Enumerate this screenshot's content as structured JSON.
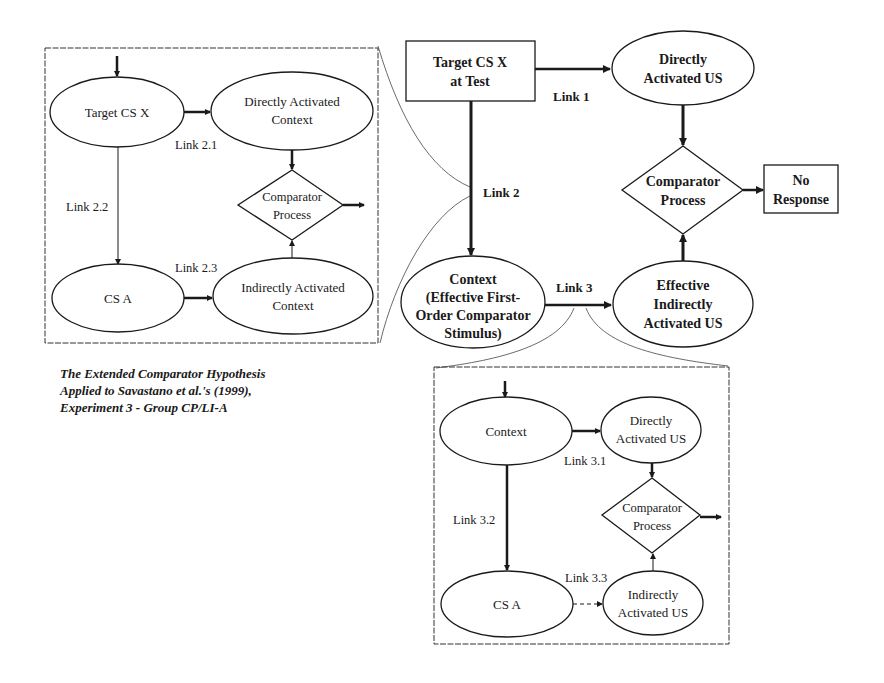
{
  "main_diagram": {
    "nodes": {
      "target": {
        "line1": "Target CS X",
        "line2": "at Test"
      },
      "direct_us": {
        "line1": "Directly",
        "line2": "Activated US"
      },
      "comparator": {
        "line1": "Comparator",
        "line2": "Process"
      },
      "no_response": {
        "line1": "No",
        "line2": "Response"
      },
      "context": {
        "line1": "Context",
        "line2": "(Effective First-",
        "line3": "Order Comparator",
        "line4": "Stimulus)"
      },
      "effective_indirect_us": {
        "line1": "Effective",
        "line2": "Indirectly",
        "line3": "Activated US"
      }
    },
    "links": {
      "link1": "Link 1",
      "link2": "Link 2",
      "link3": "Link 3"
    }
  },
  "link2_inset": {
    "nodes": {
      "target": "Target CS X",
      "direct_context": {
        "line1": "Directly Activated",
        "line2": "Context"
      },
      "comparator": {
        "line1": "Comparator",
        "line2": "Process"
      },
      "cs_a": "CS A",
      "indirect_context": {
        "line1": "Indirectly Activated",
        "line2": "Context"
      }
    },
    "links": {
      "link21": "Link 2.1",
      "link22": "Link 2.2",
      "link23": "Link 2.3"
    }
  },
  "link3_inset": {
    "nodes": {
      "context": "Context",
      "direct_us": {
        "line1": "Directly",
        "line2": "Activated US"
      },
      "comparator": {
        "line1": "Comparator",
        "line2": "Process"
      },
      "cs_a": "CS A",
      "indirect_us": {
        "line1": "Indirectly",
        "line2": "Activated US"
      }
    },
    "links": {
      "link31": "Link 3.1",
      "link32": "Link 3.2",
      "link33": "Link 3.3"
    }
  },
  "caption": {
    "line1": "The Extended Comparator Hypothesis",
    "line2": "Applied to Savastano et al.'s (1999),",
    "line3": "Experiment 3 - Group CP/LI-A"
  },
  "colors": {
    "ink": "#1a1a1a",
    "background": "#ffffff"
  }
}
